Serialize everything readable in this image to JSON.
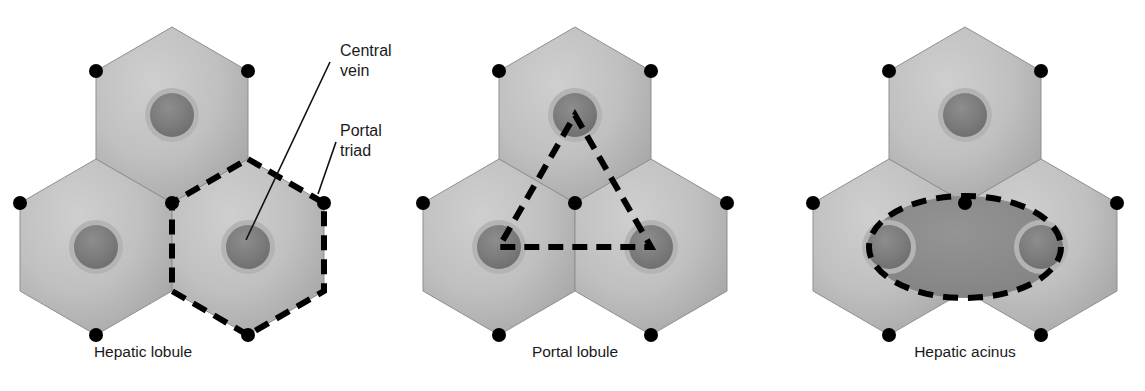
{
  "figure": {
    "background_color": "#ffffff",
    "panels": [
      {
        "id": "hepatic-lobule",
        "caption": "Hepatic lobule",
        "caption_x": 143,
        "caption_y": 357,
        "center_x": 172,
        "center_y": 193,
        "outline_shape": "hexagon",
        "outline_style": "dashed",
        "annotations": [
          {
            "id": "central-vein",
            "lines": [
              "Central",
              "vein"
            ],
            "text_x": 340,
            "text_y": 56,
            "leader_from_x": 330,
            "leader_from_y": 62,
            "leader_to_x": 246,
            "leader_to_y": 240
          },
          {
            "id": "portal-triad",
            "lines": [
              "Portal",
              "triad"
            ],
            "text_x": 340,
            "text_y": 136,
            "leader_from_x": 336,
            "leader_from_y": 142,
            "leader_to_x": 318,
            "leader_to_y": 194
          }
        ]
      },
      {
        "id": "portal-lobule",
        "caption": "Portal lobule",
        "caption_x": 575,
        "caption_y": 357,
        "center_x": 575,
        "center_y": 193,
        "outline_shape": "triangle",
        "outline_style": "dashed",
        "annotations": []
      },
      {
        "id": "hepatic-acinus",
        "caption": "Hepatic acinus",
        "caption_x": 965,
        "caption_y": 357,
        "center_x": 965,
        "center_y": 193,
        "outline_shape": "ellipse",
        "outline_style": "dashed",
        "annotations": []
      }
    ],
    "colors": {
      "hexagon_fill_light": "#c6c6c6",
      "hexagon_fill_dark": "#a8a8a8",
      "hexagon_edge": "#8f8f8f",
      "central_vein_fill": "#7d7d7d",
      "central_vein_ring": "#b0b0b0",
      "portal_triad_dot": "#000000",
      "outline_dash": "#000000",
      "acinus_fill": "#8c8c8c",
      "text": "#1a1a1a",
      "leader_line": "#111111"
    },
    "geometry": {
      "hex_radius": 88,
      "vein_radius": 22,
      "vein_ring_radius": 27,
      "triad_dot_radius": 7
    }
  }
}
